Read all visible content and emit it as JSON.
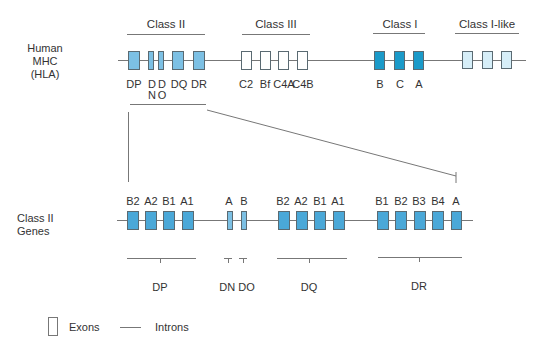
{
  "colors": {
    "class_ii_top": "#7cc0e4",
    "class_ii_genes": "#4aa8d8",
    "class_iii": "#ffffff",
    "class_i": "#1a9ac9",
    "class_i_like": "#d6eef8",
    "line": "#777777",
    "border": "#5a6a72"
  },
  "top_row": {
    "label_lines": [
      "Human",
      "MHC",
      "(HLA)"
    ],
    "groups": [
      {
        "heading": "Class II",
        "genes": [
          "DP",
          "D N",
          "D O",
          "DQ",
          "DR"
        ]
      },
      {
        "heading": "Class III",
        "genes": [
          "C2",
          "Bf",
          "C4A",
          "C4B"
        ]
      },
      {
        "heading": "Class I",
        "genes": [
          "B",
          "C",
          "A"
        ]
      },
      {
        "heading": "Class I-like",
        "genes": []
      }
    ],
    "gene_labels": {
      "dp": "DP",
      "dn_top": "D",
      "dn_bottom": "N",
      "do_top": "D",
      "do_bottom": "O",
      "dq": "DQ",
      "dr": "DR",
      "c2": "C2",
      "bf": "Bf",
      "c4a": "C4A",
      "c4b": "C4B",
      "b": "B",
      "c": "C",
      "a": "A"
    }
  },
  "bottom_row": {
    "label_lines": [
      "Class II",
      "Genes"
    ],
    "groups": [
      {
        "name": "DP",
        "exons": [
          "B2",
          "A2",
          "B1",
          "A1"
        ]
      },
      {
        "name": "DN",
        "exons": [
          "A"
        ]
      },
      {
        "name": "DO",
        "exons": [
          "B"
        ]
      },
      {
        "name": "DQ",
        "exons": [
          "B2",
          "A2",
          "B1",
          "A1"
        ]
      },
      {
        "name": "DR",
        "exons": [
          "B1",
          "B2",
          "B3",
          "B4",
          "A"
        ]
      }
    ],
    "group_labels": {
      "dp": "DP",
      "dn_do": "DN DO",
      "dq": "DQ",
      "dr": "DR"
    }
  },
  "legend": {
    "exons": "Exons",
    "introns": "Introns"
  }
}
